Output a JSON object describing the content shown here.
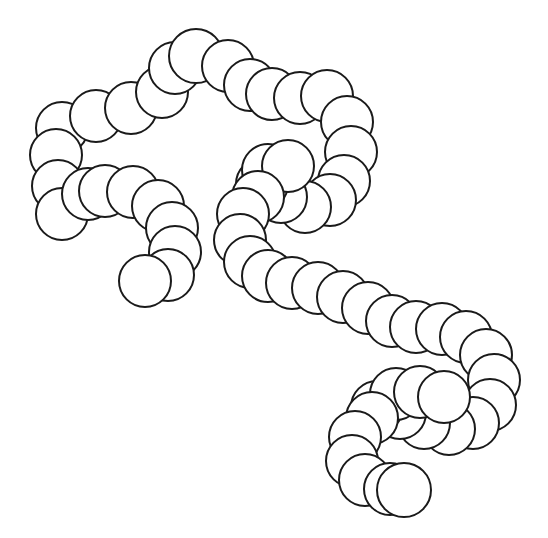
{
  "canvas": {
    "width": 548,
    "height": 538,
    "background_color": "#ffffff",
    "stroke_color": "#1a1a1a",
    "fill_color": "#ffffff",
    "stroke_width": 2,
    "title": "Chain of overlapping circles line drawing"
  },
  "artwork": {
    "type": "line-art",
    "description": "Branching chains of overlapping outlined circles forming a meandering beaded filament",
    "bead_radius_default": 25,
    "branch_count": 4,
    "total_beads": 79
  },
  "branches": [
    {
      "name": "left-upper-arch",
      "label": "Left upper arch branch",
      "beads": [
        {
          "cx": 62,
          "cy": 128,
          "r": 26
        },
        {
          "cx": 56,
          "cy": 155,
          "r": 26
        },
        {
          "cx": 58,
          "cy": 186,
          "r": 26
        },
        {
          "cx": 62,
          "cy": 214,
          "r": 26
        },
        {
          "cx": 96,
          "cy": 116,
          "r": 26
        },
        {
          "cx": 131,
          "cy": 108,
          "r": 26
        },
        {
          "cx": 162,
          "cy": 92,
          "r": 26
        },
        {
          "cx": 175,
          "cy": 68,
          "r": 26
        },
        {
          "cx": 196,
          "cy": 56,
          "r": 27
        },
        {
          "cx": 228,
          "cy": 66,
          "r": 26
        },
        {
          "cx": 250,
          "cy": 85,
          "r": 26
        },
        {
          "cx": 272,
          "cy": 94,
          "r": 26
        },
        {
          "cx": 300,
          "cy": 98,
          "r": 26
        },
        {
          "cx": 327,
          "cy": 96,
          "r": 26
        }
      ]
    },
    {
      "name": "right-upper-descender",
      "label": "Right descending chain from top arch",
      "beads": [
        {
          "cx": 347,
          "cy": 122,
          "r": 26
        },
        {
          "cx": 351,
          "cy": 152,
          "r": 26
        },
        {
          "cx": 344,
          "cy": 181,
          "r": 26
        },
        {
          "cx": 330,
          "cy": 200,
          "r": 26
        },
        {
          "cx": 305,
          "cy": 207,
          "r": 26
        },
        {
          "cx": 281,
          "cy": 197,
          "r": 26
        },
        {
          "cx": 262,
          "cy": 184,
          "r": 26
        },
        {
          "cx": 268,
          "cy": 170,
          "r": 26
        },
        {
          "cx": 288,
          "cy": 166,
          "r": 26
        }
      ]
    },
    {
      "name": "left-lower-branch",
      "label": "Left lower terminating branch",
      "beads": [
        {
          "cx": 88,
          "cy": 194,
          "r": 26
        },
        {
          "cx": 105,
          "cy": 191,
          "r": 26
        },
        {
          "cx": 133,
          "cy": 192,
          "r": 26
        },
        {
          "cx": 158,
          "cy": 206,
          "r": 26
        },
        {
          "cx": 172,
          "cy": 228,
          "r": 26
        },
        {
          "cx": 175,
          "cy": 252,
          "r": 26
        },
        {
          "cx": 168,
          "cy": 275,
          "r": 26
        },
        {
          "cx": 145,
          "cy": 281,
          "r": 26
        }
      ]
    },
    {
      "name": "center-hook",
      "label": "Central U-shaped hook",
      "beads": [
        {
          "cx": 258,
          "cy": 197,
          "r": 26
        },
        {
          "cx": 243,
          "cy": 214,
          "r": 26
        },
        {
          "cx": 240,
          "cy": 240,
          "r": 26
        },
        {
          "cx": 250,
          "cy": 262,
          "r": 26
        },
        {
          "cx": 268,
          "cy": 276,
          "r": 26
        },
        {
          "cx": 292,
          "cy": 283,
          "r": 26
        },
        {
          "cx": 318,
          "cy": 288,
          "r": 26
        },
        {
          "cx": 343,
          "cy": 297,
          "r": 26
        },
        {
          "cx": 368,
          "cy": 308,
          "r": 26
        },
        {
          "cx": 392,
          "cy": 321,
          "r": 26
        },
        {
          "cx": 416,
          "cy": 327,
          "r": 26
        },
        {
          "cx": 442,
          "cy": 329,
          "r": 26
        },
        {
          "cx": 466,
          "cy": 337,
          "r": 26
        },
        {
          "cx": 486,
          "cy": 355,
          "r": 26
        },
        {
          "cx": 494,
          "cy": 380,
          "r": 26
        },
        {
          "cx": 490,
          "cy": 405,
          "r": 26
        },
        {
          "cx": 473,
          "cy": 423,
          "r": 26
        },
        {
          "cx": 449,
          "cy": 429,
          "r": 26
        },
        {
          "cx": 424,
          "cy": 423,
          "r": 26
        },
        {
          "cx": 400,
          "cy": 413,
          "r": 26
        },
        {
          "cx": 377,
          "cy": 407,
          "r": 26
        },
        {
          "cx": 396,
          "cy": 394,
          "r": 26
        },
        {
          "cx": 420,
          "cy": 392,
          "r": 26
        },
        {
          "cx": 444,
          "cy": 397,
          "r": 26
        }
      ]
    },
    {
      "name": "bottom-hook",
      "label": "Bottom-left curling tail",
      "beads": [
        {
          "cx": 372,
          "cy": 418,
          "r": 26
        },
        {
          "cx": 355,
          "cy": 437,
          "r": 26
        },
        {
          "cx": 352,
          "cy": 461,
          "r": 26
        },
        {
          "cx": 365,
          "cy": 480,
          "r": 26
        },
        {
          "cx": 390,
          "cy": 489,
          "r": 26
        },
        {
          "cx": 404,
          "cy": 490,
          "r": 27
        }
      ]
    }
  ]
}
